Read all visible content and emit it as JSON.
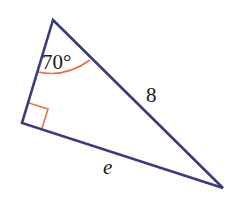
{
  "diagram": {
    "type": "right-triangle",
    "colors": {
      "edge": "#3b3b7a",
      "marker": "#e8704a",
      "text": "#1a1a1a"
    },
    "vertices": {
      "top": [
        53,
        20
      ],
      "right_angle": [
        22,
        123
      ],
      "bottom_right": [
        223,
        188
      ]
    },
    "labels": {
      "angle": "70°",
      "hypotenuse": "8",
      "bottom_side": "e"
    }
  }
}
